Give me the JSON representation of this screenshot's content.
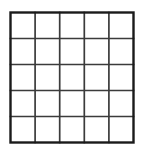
{
  "figure": {
    "title": "",
    "kind": "grid-table",
    "background_color": "#ffffff"
  },
  "grid": {
    "rows": 5,
    "columns": 5,
    "cell_count": 25,
    "outer_border_color": "#1a1a1a",
    "outer_border_width": 2.4,
    "inner_line_color": "#3b3b3b",
    "inner_line_width": 1.7,
    "cell_fill_color": "#ffffff",
    "bounds": {
      "x": 10.5,
      "y": 12.5,
      "width": 123,
      "height": 130
    },
    "x_positions": [
      10.5,
      35.1,
      59.7,
      84.3,
      108.9,
      133.5
    ],
    "y_positions": [
      12.5,
      38.5,
      64.5,
      90.5,
      116.5,
      142.5
    ],
    "cells": [
      {
        "row": 1,
        "col": 1,
        "label": ""
      },
      {
        "row": 1,
        "col": 2,
        "label": ""
      },
      {
        "row": 1,
        "col": 3,
        "label": ""
      },
      {
        "row": 1,
        "col": 4,
        "label": ""
      },
      {
        "row": 1,
        "col": 5,
        "label": ""
      },
      {
        "row": 2,
        "col": 1,
        "label": ""
      },
      {
        "row": 2,
        "col": 2,
        "label": ""
      },
      {
        "row": 2,
        "col": 3,
        "label": ""
      },
      {
        "row": 2,
        "col": 4,
        "label": ""
      },
      {
        "row": 2,
        "col": 5,
        "label": ""
      },
      {
        "row": 3,
        "col": 1,
        "label": ""
      },
      {
        "row": 3,
        "col": 2,
        "label": ""
      },
      {
        "row": 3,
        "col": 3,
        "label": ""
      },
      {
        "row": 3,
        "col": 4,
        "label": ""
      },
      {
        "row": 3,
        "col": 5,
        "label": ""
      },
      {
        "row": 4,
        "col": 1,
        "label": ""
      },
      {
        "row": 4,
        "col": 2,
        "label": ""
      },
      {
        "row": 4,
        "col": 3,
        "label": ""
      },
      {
        "row": 4,
        "col": 4,
        "label": ""
      },
      {
        "row": 4,
        "col": 5,
        "label": ""
      },
      {
        "row": 5,
        "col": 1,
        "label": ""
      },
      {
        "row": 5,
        "col": 2,
        "label": ""
      },
      {
        "row": 5,
        "col": 3,
        "label": ""
      },
      {
        "row": 5,
        "col": 4,
        "label": ""
      },
      {
        "row": 5,
        "col": 5,
        "label": ""
      }
    ]
  }
}
